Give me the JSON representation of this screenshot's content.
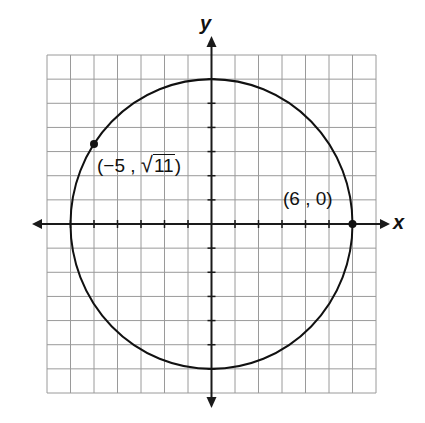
{
  "diagram": {
    "type": "coordinate-plane-circle",
    "axes": {
      "x_label": "x",
      "y_label": "y",
      "x_range": [
        -7,
        7
      ],
      "y_range": [
        -7,
        7
      ],
      "grid_unit": 1,
      "tick_marks": true
    },
    "circle": {
      "center": [
        0,
        0
      ],
      "radius": 6
    },
    "points": [
      {
        "id": "p1",
        "label": "(−5 , √11)",
        "label_prefix": "(−5 , ",
        "radicand": "11",
        "label_suffix": ")",
        "x": -5,
        "y_sqrt": 11
      },
      {
        "id": "p2",
        "label": "(6 , 0)",
        "x": 6,
        "y": 0
      }
    ],
    "colors": {
      "grid": "#9a9a9a",
      "axis": "#1a1a1a",
      "curve": "#111111",
      "background": "#ffffff"
    }
  }
}
